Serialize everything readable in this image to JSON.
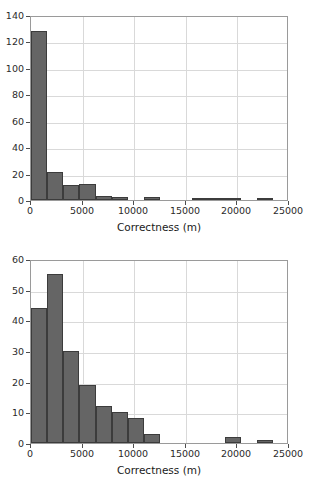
{
  "chart_data": [
    {
      "type": "bar",
      "title": "",
      "subtitle": "",
      "xlabel": "Correctness (m)",
      "ylabel": "",
      "xlim": [
        0,
        25000
      ],
      "ylim": [
        0,
        140
      ],
      "xticks": [
        0,
        5000,
        10000,
        15000,
        20000,
        25000
      ],
      "xtick_labels": [
        "0",
        "5000",
        "10000",
        "15000",
        "20000",
        "25000"
      ],
      "yticks": [
        0,
        20,
        40,
        60,
        80,
        100,
        120,
        140
      ],
      "ytick_labels": [
        "0",
        "20",
        "40",
        "60",
        "80",
        "100",
        "120",
        "140"
      ],
      "grid": true,
      "legend": false,
      "bin_width": 1562.5,
      "bin_edges": [
        0,
        1562.5,
        3125,
        4687.5,
        6250,
        7812.5,
        9375,
        10937.5,
        12500,
        14062.5,
        15625,
        17187.5,
        18750,
        20312.5,
        21875,
        23437.5,
        25000
      ],
      "categories": [
        "0-1563",
        "1563-3125",
        "3125-4688",
        "4688-6250",
        "6250-7813",
        "7813-9375",
        "9375-10938",
        "10938-12500",
        "12500-14063",
        "14063-15625",
        "15625-17188",
        "17188-18750",
        "18750-20313",
        "20313-21875",
        "21875-23438",
        "23438-25000"
      ],
      "values": [
        128,
        21,
        11,
        12,
        3,
        2,
        0,
        2,
        0,
        0,
        1,
        1,
        1,
        0,
        1,
        0
      ],
      "bar_color": "#656565",
      "bar_edge_color": "#3c3c3c"
    },
    {
      "type": "bar",
      "title": "",
      "subtitle": "",
      "xlabel": "Correctness (m)",
      "ylabel": "",
      "xlim": [
        0,
        25000
      ],
      "ylim": [
        0,
        60
      ],
      "xticks": [
        0,
        5000,
        10000,
        15000,
        20000,
        25000
      ],
      "xtick_labels": [
        "0",
        "5000",
        "10000",
        "15000",
        "20000",
        "25000"
      ],
      "yticks": [
        0,
        10,
        20,
        30,
        40,
        50,
        60
      ],
      "ytick_labels": [
        "0",
        "10",
        "20",
        "30",
        "40",
        "50",
        "60"
      ],
      "grid": true,
      "legend": false,
      "bin_width": 1562.5,
      "bin_edges": [
        0,
        1562.5,
        3125,
        4687.5,
        6250,
        7812.5,
        9375,
        10937.5,
        12500,
        14062.5,
        15625,
        17187.5,
        18750,
        20312.5,
        21875,
        23437.5,
        25000
      ],
      "categories": [
        "0-1563",
        "1563-3125",
        "3125-4688",
        "4688-6250",
        "6250-7813",
        "7813-9375",
        "9375-10938",
        "10938-12500",
        "12500-14063",
        "14063-15625",
        "15625-17188",
        "17188-18750",
        "18750-20313",
        "20313-21875",
        "21875-23438",
        "23438-25000"
      ],
      "values": [
        44,
        55,
        30,
        19,
        12,
        10,
        8,
        3,
        0,
        0,
        0,
        0,
        2,
        0,
        1,
        0
      ],
      "bar_color": "#656565",
      "bar_edge_color": "#3c3c3c"
    }
  ]
}
